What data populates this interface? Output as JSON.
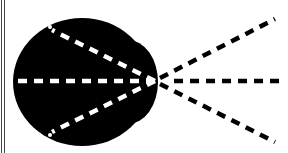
{
  "diagram": {
    "colors": {
      "background": "#ffffff",
      "body": "#000000",
      "inner_rays": "#ffffff",
      "outer_rays": "#000000",
      "border": "#444444"
    },
    "focal_point": {
      "x": 155,
      "y": 81
    },
    "inner_rays": [
      {
        "name": "upper",
        "x1": 48,
        "y1": 29,
        "x2": 155,
        "y2": 81
      },
      {
        "name": "middle",
        "x1": 13,
        "y1": 81,
        "x2": 155,
        "y2": 81
      },
      {
        "name": "lower",
        "x1": 48,
        "y1": 133,
        "x2": 155,
        "y2": 81
      }
    ],
    "outer_rays": [
      {
        "name": "upper",
        "x1": 155,
        "y1": 81,
        "x2": 275,
        "y2": 19
      },
      {
        "name": "middle",
        "x1": 155,
        "y1": 81,
        "x2": 285,
        "y2": 81
      },
      {
        "name": "lower",
        "x1": 155,
        "y1": 81,
        "x2": 275,
        "y2": 142
      }
    ]
  }
}
